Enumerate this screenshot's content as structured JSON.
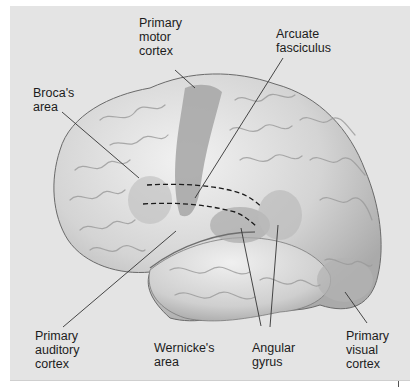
{
  "diagram": {
    "type": "labeled-anatomy-illustration",
    "colors": {
      "background": "#e4e4e4",
      "brain_base": "#c9c9c9",
      "brain_highlight": "#efefef",
      "highlighted_region": "#a9a9a9",
      "leader_line": "#333333",
      "text": "#1c1c1c"
    },
    "labels": [
      {
        "id": "primary-motor-cortex",
        "lines": [
          "Primary",
          "motor",
          "cortex"
        ]
      },
      {
        "id": "arcuate-fasciculus",
        "lines": [
          "Arcuate",
          "fasciculus"
        ]
      },
      {
        "id": "brocas-area",
        "lines": [
          "Broca's",
          "area"
        ]
      },
      {
        "id": "primary-auditory-cortex",
        "lines": [
          "Primary",
          "auditory",
          "cortex"
        ]
      },
      {
        "id": "wernickes-area",
        "lines": [
          "Wernicke's",
          "area"
        ]
      },
      {
        "id": "angular-gyrus",
        "lines": [
          "Angular",
          "gyrus"
        ]
      },
      {
        "id": "primary-visual-cortex",
        "lines": [
          "Primary",
          "visual",
          "cortex"
        ]
      }
    ]
  }
}
